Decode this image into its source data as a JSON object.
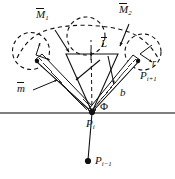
{
  "figure": {
    "type": "technical-diagram",
    "width": 175,
    "height": 179,
    "background_color": "#ffffff",
    "line_color": "#111111"
  },
  "labels": {
    "moment_left": {
      "base": "M",
      "subscript": "1",
      "has_overbar": true,
      "text": "M",
      "sub": "1"
    },
    "moment_right": {
      "base": "M",
      "subscript": "2",
      "has_overbar": true,
      "text": "M",
      "sub": "2"
    },
    "length_center": {
      "base": "L",
      "has_overbar": true,
      "text": "L",
      "sub": ""
    },
    "mass_left": {
      "base": "m",
      "has_overbar": true,
      "text": "m",
      "sub": ""
    },
    "radius_right": {
      "base": "r",
      "has_overbar": false,
      "text": "r",
      "sub": ""
    },
    "width_right": {
      "base": "b",
      "has_overbar": false,
      "text": "b",
      "sub": ""
    },
    "angle_phi": {
      "base": "Φ",
      "has_overbar": false,
      "text": "Φ",
      "sub": ""
    },
    "node_right": {
      "base": "P",
      "subscript": "i+1",
      "has_overbar": false,
      "text": "P",
      "sub": "i+1"
    },
    "node_vertex": {
      "base": "P",
      "subscript": "i",
      "has_overbar": false,
      "text": "P",
      "sub": "i"
    },
    "node_below": {
      "base": "P",
      "subscript": "i-1",
      "has_overbar": false,
      "text": "P",
      "sub": "i−1"
    }
  },
  "elements": {
    "ground_line": "horizontal-ground-line",
    "dashed_circles": 3,
    "hatched_bands": 2,
    "vertex_dot": "filled-node-dot",
    "below_dot": "filled-node-dot"
  },
  "colors": {
    "stroke": "#111111",
    "background": "#ffffff",
    "ground": "#555555"
  }
}
